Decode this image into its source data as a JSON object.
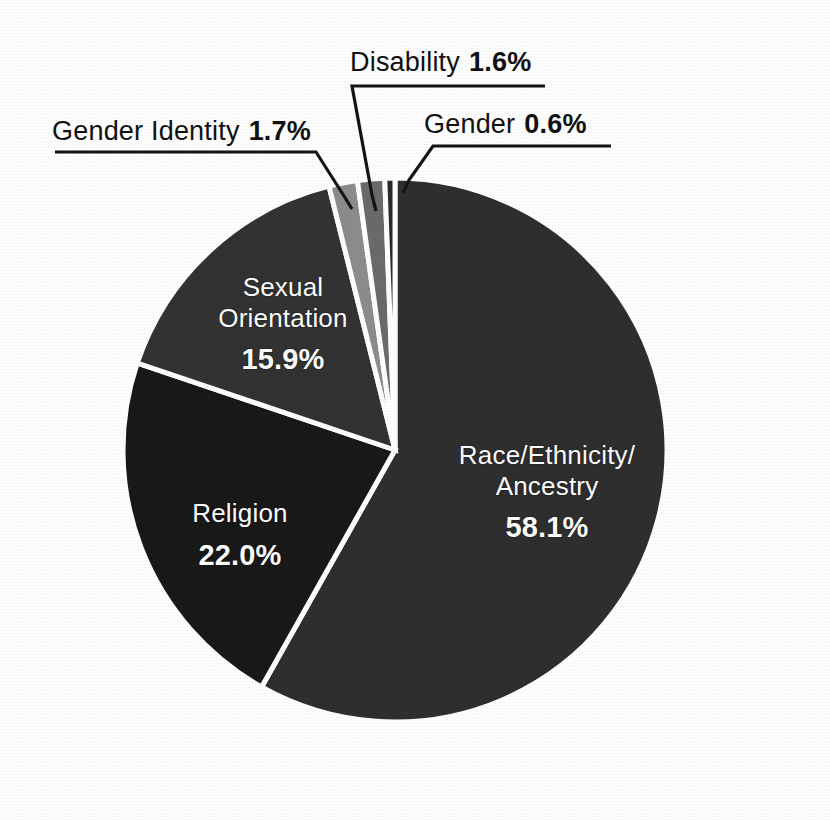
{
  "chart_data": {
    "type": "pie",
    "title": "",
    "subtitle": "",
    "xlabel": "",
    "ylabel": "",
    "legend_position": "none",
    "grid": false,
    "units": "percent",
    "total": 99.9,
    "start_angle_deg": 0,
    "direction": "clockwise",
    "categories": [
      "Race/Ethnicity/\nAncestry",
      "Religion",
      "Sexual Orientation",
      "Gender Identity",
      "Disability",
      "Gender"
    ],
    "values": [
      58.1,
      22.0,
      15.9,
      1.7,
      1.6,
      0.6
    ],
    "slices": [
      {
        "name": "race-ethnicity-ancestry",
        "label_line1": "Race/Ethnicity/",
        "label_line2": "Ancestry",
        "value": 58.1,
        "value_text": "58.1%",
        "color": "#2f2f2f",
        "label_placement": "inside"
      },
      {
        "name": "religion",
        "label_line1": "Religion",
        "label_line2": "",
        "value": 22.0,
        "value_text": "22.0%",
        "color": "#191919",
        "label_placement": "inside"
      },
      {
        "name": "sexual-orientation",
        "label_line1": "Sexual",
        "label_line2": "Orientation",
        "value": 15.9,
        "value_text": "15.9%",
        "color": "#333333",
        "label_placement": "inside"
      },
      {
        "name": "gender-identity",
        "label_line1": "Gender Identity",
        "label_line2": "",
        "value": 1.7,
        "value_text": "1.7%",
        "color": "#8d8d8d",
        "label_placement": "callout"
      },
      {
        "name": "disability",
        "label_line1": "Disability",
        "label_line2": "",
        "value": 1.6,
        "value_text": "1.6%",
        "color": "#6b6b6b",
        "label_placement": "callout"
      },
      {
        "name": "gender",
        "label_line1": "Gender",
        "label_line2": "",
        "value": 0.6,
        "value_text": "0.6%",
        "color": "#2a2a2a",
        "label_placement": "callout"
      }
    ]
  },
  "callouts": {
    "gender_identity": {
      "category": "Gender Identity",
      "value_text": "1.7%"
    },
    "disability": {
      "category": "Disability",
      "value_text": "1.6%"
    },
    "gender": {
      "category": "Gender",
      "value_text": "0.6%"
    }
  },
  "inside_labels": {
    "race": {
      "line1": "Race/Ethnicity/",
      "line2": "Ancestry",
      "value_text": "58.1%"
    },
    "religion": {
      "line1": "Religion",
      "value_text": "22.0%"
    },
    "sexual_orientation": {
      "line1": "Sexual",
      "line2": "Orientation",
      "value_text": "15.9%"
    }
  },
  "style": {
    "background": "#ffffff",
    "slice_separator": "#ffffff",
    "leader_line": "#141414",
    "inside_label_color": "#ffffff",
    "callout_label_color": "#111111"
  }
}
